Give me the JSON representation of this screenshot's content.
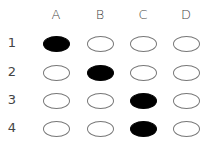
{
  "grid": {
    "columns": [
      "A",
      "B",
      "C",
      "D"
    ],
    "rows": [
      {
        "label": "1",
        "filled": "A"
      },
      {
        "label": "2",
        "filled": "B"
      },
      {
        "label": "3",
        "filled": "C"
      },
      {
        "label": "4",
        "filled": "C"
      }
    ]
  },
  "colors": {
    "filled": "#000000",
    "empty_border": "#777777",
    "text": "#444444"
  }
}
